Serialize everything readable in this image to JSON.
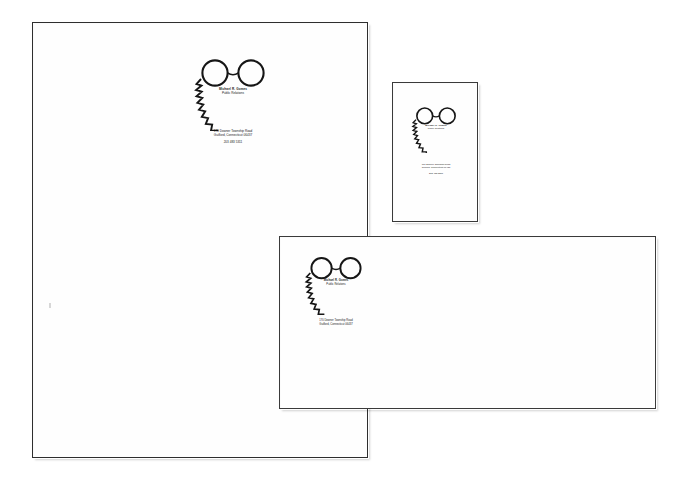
{
  "scan": {
    "background_color": "#ffffff",
    "ink_color": "#1a1a1a",
    "description": "Scanned identity stationery set"
  },
  "identity": {
    "name": "Michael R. Gomes",
    "title": "Public Relations",
    "address_line1": "170 Downer Township Road",
    "address_line2": "Guilford, Connecticut 06437",
    "phone": "203 483 5311",
    "logo_name": "glasses-beard-face-logo"
  },
  "pieces": [
    {
      "id": "letterhead",
      "label": "Letterhead"
    },
    {
      "id": "business-card",
      "label": "Business Card"
    },
    {
      "id": "envelope",
      "label": "Envelope"
    }
  ]
}
